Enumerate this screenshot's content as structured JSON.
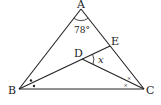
{
  "diagram": {
    "type": "geometry-triangle",
    "points": {
      "A": {
        "label": "A",
        "x": 81,
        "y": 9
      },
      "B": {
        "label": "B",
        "x": 19,
        "y": 89
      },
      "C": {
        "label": "C",
        "x": 144,
        "y": 89
      },
      "D": {
        "label": "D",
        "x": 82,
        "y": 59
      },
      "E": {
        "label": "E",
        "x": 110,
        "y": 46
      }
    },
    "segments": [
      "AB",
      "AC",
      "BC",
      "BE",
      "DC"
    ],
    "angle_A_label": "78°",
    "angle_x_label": "x",
    "markers": {
      "B_bisector": "dot",
      "C_bisector": "small-x"
    },
    "colors": {
      "line": "#222222",
      "background": "#ffffff"
    }
  }
}
